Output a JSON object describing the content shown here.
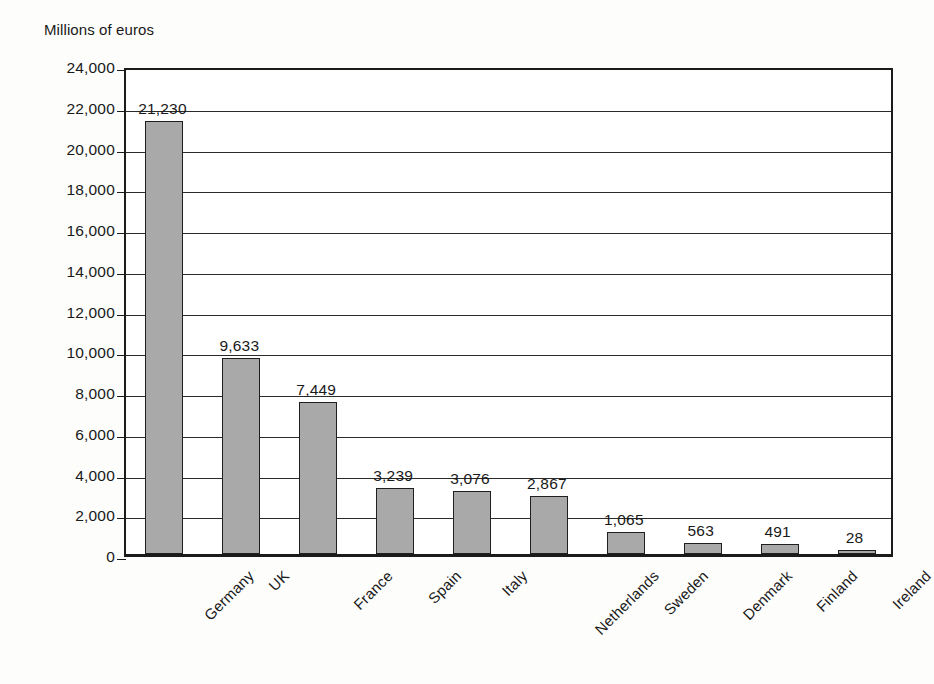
{
  "chart_data": {
    "type": "bar",
    "title": "",
    "ylabel": "Millions of euros",
    "xlabel": "",
    "categories": [
      "Germany",
      "UK",
      "France",
      "Spain",
      "Italy",
      "Netherlands",
      "Sweden",
      "Denmark",
      "Finland",
      "Ireland"
    ],
    "values": [
      21230,
      9633,
      7449,
      3239,
      3076,
      2867,
      1065,
      563,
      491,
      28
    ],
    "value_labels": [
      "21,230",
      "9,633",
      "7,449",
      "3,239",
      "3,076",
      "2,867",
      "1,065",
      "563",
      "491",
      "28"
    ],
    "ylim": [
      0,
      24000
    ],
    "ytick_values": [
      0,
      2000,
      4000,
      6000,
      8000,
      10000,
      12000,
      14000,
      16000,
      18000,
      20000,
      22000,
      24000
    ],
    "ytick_labels": [
      "0",
      "2,000",
      "4,000",
      "6,000",
      "8,000",
      "10,000",
      "12,000",
      "14,000",
      "16,000",
      "18,000",
      "20,000",
      "22,000",
      "24,000"
    ],
    "grid": true,
    "legend": false,
    "bar_color": "#a9a9a9",
    "bar_border_color": "#1f1f1f",
    "axis_color": "#1b1b1b",
    "label_rotation_deg": -45
  }
}
